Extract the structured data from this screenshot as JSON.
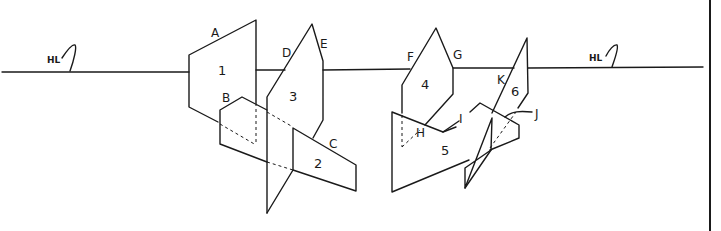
{
  "diagram": {
    "horizon_label_left": "HL",
    "horizon_label_right": "HL",
    "planes": [
      {
        "id": "1",
        "label": "1"
      },
      {
        "id": "2",
        "label": "2"
      },
      {
        "id": "3",
        "label": "3"
      },
      {
        "id": "4",
        "label": "4"
      },
      {
        "id": "5",
        "label": "5"
      },
      {
        "id": "6",
        "label": "6"
      }
    ],
    "points": {
      "A": "A",
      "B": "B",
      "C": "C",
      "D": "D",
      "E": "E",
      "F": "F",
      "G": "G",
      "H": "H",
      "I": "I",
      "J": "J",
      "K": "K"
    },
    "colors": {
      "stroke": "#1a1a1a",
      "background": "#ffffff"
    }
  }
}
